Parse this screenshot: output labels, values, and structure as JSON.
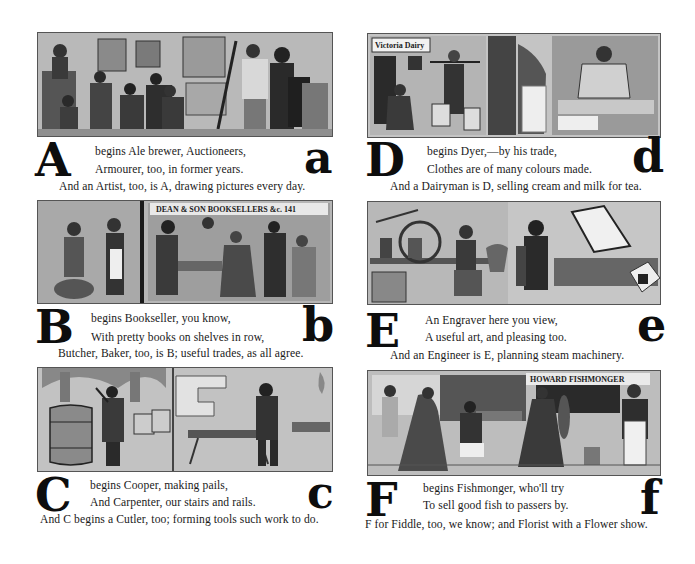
{
  "page": {
    "panels": [
      {
        "id": "A",
        "capital": "A",
        "lower": "a",
        "line1": "begins Ale brewer, Auctioneers,",
        "line2": "Armourer, too, in former years.",
        "line3": "And an Artist, too, is A, drawing pictures every day.",
        "illustration": "Auction room with auctioneer at rostrum, bidders, and an artist painting a portrait"
      },
      {
        "id": "D",
        "capital": "D",
        "lower": "d",
        "line1": "begins Dyer,—by his trade,",
        "line2": "Clothes are of many colours made.",
        "line3": "And a Dairyman is D, selling cream and milk for tea.",
        "illustration": "Dairyman with yoke and pails at a shop door; dyer at work",
        "sign": "Victoria Dairy"
      },
      {
        "id": "B",
        "capital": "B",
        "lower": "b",
        "line1": "begins Bookseller, you know,",
        "line2": "With pretty books on shelves in row,",
        "line3": "Butcher, Baker, too, is B; useful trades, as all agree.",
        "illustration": "Baker and customer; bookshop interior with customers",
        "sign": "DEAN & SON  BOOKSELLERS &c. 141"
      },
      {
        "id": "E",
        "capital": "E",
        "lower": "e",
        "line1": "An Engraver here you view,",
        "line2": "A useful art, and pleasing too.",
        "line3": "And an Engineer is E, planning steam machinery.",
        "illustration": "Engineer at bench with steam model; engraver working by a window"
      },
      {
        "id": "C",
        "capital": "C",
        "lower": "c",
        "line1": "begins Cooper, making pails,",
        "line2": "And Carpenter, our stairs and rails.",
        "line3": "And C begins a Cutler, too; forming tools such work to do.",
        "illustration": "Cooper hammering a barrel; carpenter sawing at a sawhorse"
      },
      {
        "id": "F",
        "capital": "F",
        "lower": "f",
        "line1": "begins Fishmonger, who'll try",
        "line2": "To sell good fish to passers by.",
        "line3": "F for Fiddle, too, we know; and Florist with a Flower show.",
        "illustration": "Street scene with florist stall, ladies, and fishmonger in apron",
        "sign": "HOWARD  FISHMONGER"
      }
    ]
  }
}
